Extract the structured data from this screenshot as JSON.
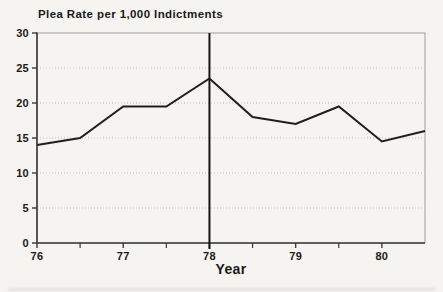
{
  "page": {
    "background": "#f5f4f0"
  },
  "chart_data": {
    "type": "line",
    "title": "Plea Rate per 1,000 Indictments",
    "xlabel": "Year",
    "ylabel": "",
    "x": [
      76,
      76.5,
      77,
      77.5,
      78,
      78.5,
      79,
      79.5,
      80,
      80.5
    ],
    "values": [
      14,
      15,
      19.5,
      19.5,
      23.5,
      18,
      17,
      19.5,
      14.5,
      16
    ],
    "xlim": [
      76,
      80.5
    ],
    "ylim": [
      0,
      30
    ],
    "x_ticks": [
      76,
      77,
      78,
      79,
      80
    ],
    "x_minor_ticks": [
      76.5,
      77.5,
      78.5,
      79.5
    ],
    "y_ticks": [
      0,
      5,
      10,
      15,
      20,
      25,
      30
    ],
    "grid": "horizontal-dotted",
    "legend": "none",
    "reference_line_x": 78,
    "colors": {
      "line": "#1f1f1f",
      "reference_line": "#151515",
      "axis": "#3a3a3a",
      "frame": "#9e9e9e",
      "grid": "#c0c0c0",
      "text": "#1a1a1a"
    }
  }
}
